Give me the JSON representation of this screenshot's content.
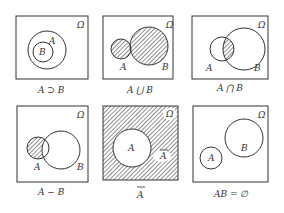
{
  "universe_label": "Ω",
  "panels": [
    {
      "id": "subset",
      "caption": "A ⊃ B",
      "labels": {
        "a": "A",
        "b": "B",
        "omega": "Ω"
      }
    },
    {
      "id": "union",
      "caption": "A ⋃ B",
      "labels": {
        "a": "A",
        "b": "B",
        "omega": "Ω"
      }
    },
    {
      "id": "intersection",
      "caption": "A ⋂ B",
      "labels": {
        "a": "A",
        "b": "B",
        "omega": "Ω"
      }
    },
    {
      "id": "difference",
      "caption": "A − B",
      "labels": {
        "a": "A",
        "b": "B",
        "omega": "Ω"
      }
    },
    {
      "id": "complement",
      "caption": "A",
      "labels": {
        "a": "A",
        "abar": "A",
        "omega": "Ω"
      }
    },
    {
      "id": "disjoint",
      "caption": "AB = ∅",
      "labels": {
        "a": "A",
        "b": "B",
        "omega": "Ω"
      }
    }
  ],
  "colors": {
    "stroke": "#333333",
    "hatch": "#333333",
    "background": "#ffffff"
  }
}
